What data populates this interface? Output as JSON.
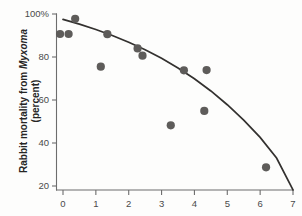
{
  "chart_data": {
    "type": "scatter",
    "title": "",
    "subtitle": "",
    "xlabel": "",
    "ylabel_line1_prefix": "Rabbit mortality from ",
    "ylabel_line1_italic": "Myxoma",
    "ylabel_line2": "(percent)",
    "xlim": [
      -0.35,
      7
    ],
    "ylim": [
      17,
      100
    ],
    "grid": false,
    "legend": null,
    "xticks": [
      0,
      1,
      2,
      3,
      4,
      5,
      6,
      7
    ],
    "xticklabels": [
      "0",
      "1",
      "2",
      "3",
      "4",
      "5",
      "6",
      "7"
    ],
    "yticks": [
      20,
      40,
      60,
      80,
      100
    ],
    "yticklabels": [
      "20",
      "40",
      "60",
      "80",
      "100%"
    ],
    "point_color": "#5e5c5a",
    "curve_color": "#33312f",
    "axis_color": "#6d6d6d",
    "points": [
      {
        "x": 0.37,
        "y": 97.8
      },
      {
        "x": -0.09,
        "y": 90.7
      },
      {
        "x": 0.17,
        "y": 90.7
      },
      {
        "x": 1.15,
        "y": 75.5
      },
      {
        "x": 1.35,
        "y": 90.6
      },
      {
        "x": 2.27,
        "y": 84.0
      },
      {
        "x": 2.42,
        "y": 80.6
      },
      {
        "x": 3.28,
        "y": 48.2
      },
      {
        "x": 3.68,
        "y": 73.8
      },
      {
        "x": 4.3,
        "y": 54.9
      },
      {
        "x": 4.37,
        "y": 73.9
      },
      {
        "x": 6.18,
        "y": 28.7
      }
    ],
    "series": [
      {
        "name": "fitted-curve",
        "type": "line",
        "x": [
          0.0,
          0.5,
          1.0,
          1.5,
          2.0,
          2.5,
          3.0,
          3.5,
          4.0,
          4.5,
          5.0,
          5.5,
          6.0,
          6.5,
          7.0
        ],
        "y": [
          97.5,
          95.3,
          92.8,
          90.0,
          86.9,
          83.4,
          79.4,
          74.9,
          69.9,
          64.2,
          57.8,
          50.6,
          42.6,
          33.0,
          18.2
        ]
      }
    ]
  }
}
